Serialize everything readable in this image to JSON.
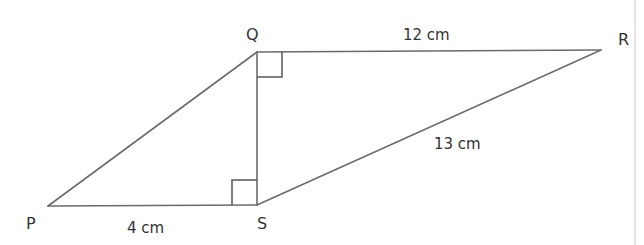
{
  "diagram": {
    "title": "",
    "colors": {
      "line": "#6b6b6b",
      "text": "#333333",
      "background": "#ffffff",
      "border": "#d4d4d4"
    },
    "vertices": {
      "P": {
        "label": "P",
        "x": 48,
        "y": 206
      },
      "Q": {
        "label": "Q",
        "x": 257,
        "y": 52
      },
      "R": {
        "label": "R",
        "x": 601,
        "y": 50
      },
      "S": {
        "label": "S",
        "x": 257,
        "y": 205
      }
    },
    "segments": [
      {
        "from": "P",
        "to": "S",
        "length_label": "4 cm"
      },
      {
        "from": "Q",
        "to": "R",
        "length_label": "12 cm"
      },
      {
        "from": "S",
        "to": "R",
        "length_label": "13 cm"
      },
      {
        "from": "P",
        "to": "Q",
        "length_label": ""
      },
      {
        "from": "Q",
        "to": "S",
        "length_label": ""
      }
    ],
    "right_angles": [
      {
        "at": "Q",
        "between": [
          "S",
          "R"
        ]
      },
      {
        "at": "S",
        "between": [
          "P",
          "Q"
        ]
      }
    ],
    "labels": {
      "P": "P",
      "Q": "Q",
      "R": "R",
      "S": "S",
      "PS": "4 cm",
      "QR": "12 cm",
      "SR": "13 cm"
    }
  }
}
